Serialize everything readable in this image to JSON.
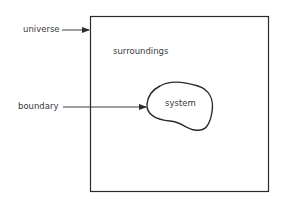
{
  "diagram": {
    "labels": {
      "universe": "universe",
      "surroundings": "surroundings",
      "boundary": "boundary",
      "system": "system"
    },
    "colors": {
      "stroke": "#2b2b2b",
      "text": "#3a3a3a",
      "background": "#ffffff"
    }
  }
}
